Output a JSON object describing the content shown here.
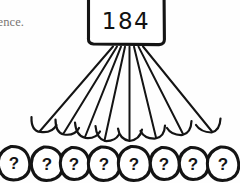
{
  "worksheet": {
    "prompt": {
      "line_1": "ie",
      "line_2": "entence."
    },
    "total_box": {
      "value": "184",
      "shape": "rounded-rectangle"
    },
    "branches": {
      "count": 8,
      "arrow_style": "curved-hook-arrowhead",
      "origin": "bottom-edge-of-total-box"
    },
    "answer_bubbles": [
      {
        "label": "?",
        "index": 1
      },
      {
        "label": "?",
        "index": 2
      },
      {
        "label": "?",
        "index": 3
      },
      {
        "label": "?",
        "index": 4
      },
      {
        "label": "?",
        "index": 5
      },
      {
        "label": "?",
        "index": 6
      },
      {
        "label": "?",
        "index": 7
      },
      {
        "label": "?",
        "index": 8
      }
    ],
    "colors": {
      "ink": "#141414",
      "paper": "#fefefe",
      "text_gray": "#6e6a68"
    }
  }
}
